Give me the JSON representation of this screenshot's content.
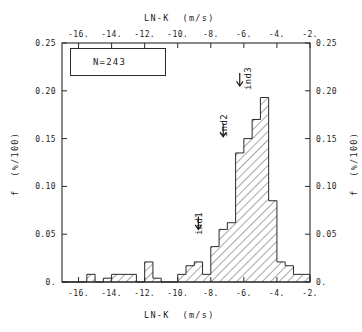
{
  "figure": {
    "top_axis_title": "LN-K  (m/s)",
    "bottom_axis_title": "LN-K  (m/s)",
    "left_axis_title": "f  (%/100)",
    "right_axis_title": "f  (%/100)",
    "legend_label": "N=243"
  },
  "annotations": [
    {
      "name": "ind1",
      "label": "ind1",
      "x": -8.75,
      "y": 0.055
    },
    {
      "name": "ind2",
      "label": "ind2",
      "x": -7.25,
      "y": 0.152
    },
    {
      "name": "ind3",
      "label": "ind3",
      "x": -6.25,
      "y": 0.205
    }
  ],
  "chart_data": {
    "type": "bar",
    "title": "",
    "subtitle": "",
    "xlabel": "LN-K  (m/s)",
    "ylabel": "f  (%/100)",
    "xlim": [
      -17.0,
      -2.0
    ],
    "ylim": [
      0.0,
      0.25
    ],
    "grid": false,
    "legend": "N=243",
    "sample_size": 243,
    "bin_width": 0.5,
    "xticks": [
      -16,
      -14,
      -12,
      -10,
      -8,
      -6,
      -4,
      -2
    ],
    "xticklabels": [
      "-16.",
      "-14.",
      "-12.",
      "-10.",
      "-8.",
      "-6.",
      "-4.",
      "-2."
    ],
    "yticks": [
      0.0,
      0.05,
      0.1,
      0.15,
      0.2,
      0.25
    ],
    "yticklabels": [
      "0.",
      "0.05",
      "0.10",
      "0.15",
      "0.20",
      "0.25"
    ],
    "bin_left_edges": [
      -17.0,
      -16.5,
      -16.0,
      -15.5,
      -15.0,
      -14.5,
      -14.0,
      -13.5,
      -13.0,
      -12.5,
      -12.0,
      -11.5,
      -11.0,
      -10.5,
      -10.0,
      -9.5,
      -9.0,
      -8.5,
      -8.0,
      -7.5,
      -7.0,
      -6.5,
      -6.0,
      -5.5,
      -5.0,
      -4.5,
      -4.0,
      -3.5,
      -3.0,
      -2.5
    ],
    "values": [
      0.0,
      0.0,
      0.0,
      0.008,
      0.0,
      0.004,
      0.008,
      0.008,
      0.008,
      0.0,
      0.021,
      0.004,
      0.0,
      0.0,
      0.008,
      0.017,
      0.021,
      0.008,
      0.037,
      0.055,
      0.062,
      0.135,
      0.15,
      0.17,
      0.193,
      0.085,
      0.021,
      0.017,
      0.008,
      0.008
    ],
    "peak": {
      "x": -5.0,
      "y": 0.193
    }
  }
}
